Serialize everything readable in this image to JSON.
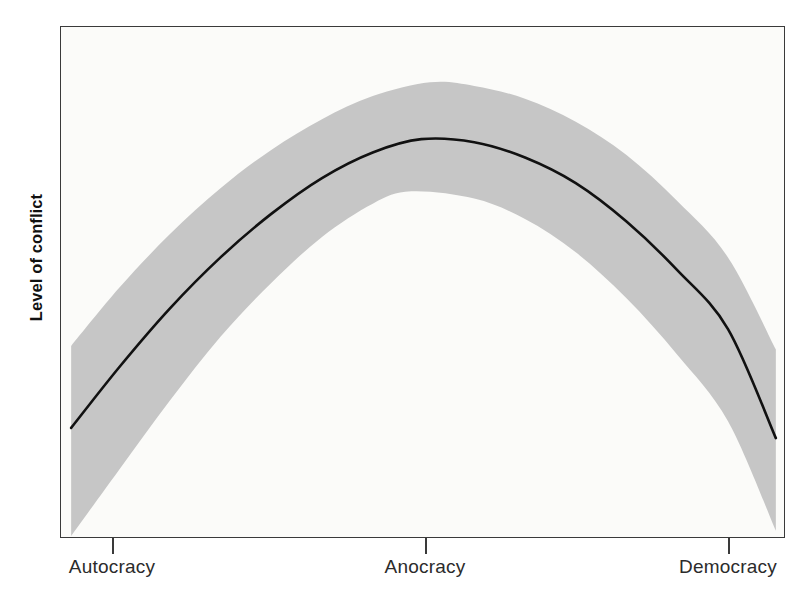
{
  "figure": {
    "y_axis_label": "Level of conflict",
    "background_color": "#fbfbf9",
    "frame_color": "#3a3a3a",
    "band_color": "#c6c6c6",
    "line_color": "#111111",
    "page_bleed_text": "thickened the relationship between regime type and civil conflict has been one of the most durable findings in the comparative study of political violence. Scholars working in this tradition have repeatedly observed that states occupying the institutional middle ground are substantially more prone to internal armed conflict than either consolidated autocracies or consolidated democracies. The relationship is therefore not monotonic but curvilinear: it rises, peaks, and falls again across the regime spectrum. Consolidated autocracies suppress dissent through coercive capacity, while consolidated democracies channel grievances through responsive institutions and credible electoral competition. Anocracies, by contrast, combine partially open institutions with limited coercive reach and weak capacity for accommodation, producing the worst of both worlds. The inverted U depicted here summarizes the pattern, and the shaded region around the fitted line reports the associated uncertainty, which widens considerably toward the extremes of the scale where observations are comparatively sparse."
  },
  "chart_data": {
    "type": "line",
    "title": "",
    "xlabel": "",
    "ylabel": "Level of conflict",
    "grid": false,
    "legend": "none",
    "xlim": [
      0,
      100
    ],
    "ylim": [
      0,
      100
    ],
    "xtick_labels": [
      "Autocracy",
      "Anocracy",
      "Democracy"
    ],
    "xtick_positions": [
      7.2,
      50.3,
      92.1
    ],
    "ytick_labels": [],
    "annotations": [],
    "series": [
      {
        "name": "Fitted level of conflict",
        "type": "line",
        "x": [
          1.4,
          8,
          15,
          22,
          29,
          36,
          43,
          49.7,
          57,
          64,
          71,
          78,
          85,
          92,
          98.6
        ],
        "y": [
          21.7,
          33.5,
          45.0,
          55.0,
          63.5,
          70.5,
          75.5,
          78.1,
          77.5,
          74.5,
          69.5,
          62.0,
          52.5,
          41.0,
          19.7
        ]
      },
      {
        "name": "Upper confidence bound",
        "type": "band_upper",
        "x": [
          1.4,
          8,
          15,
          22,
          29,
          36,
          43,
          50.9,
          57,
          64,
          71,
          78,
          85,
          92,
          98.6
        ],
        "y": [
          37.7,
          49.0,
          59.5,
          68.5,
          76.0,
          82.0,
          86.5,
          89.2,
          88.5,
          86.0,
          81.5,
          75.0,
          66.0,
          55.0,
          37.0
        ]
      },
      {
        "name": "Lower confidence bound",
        "type": "band_lower",
        "x": [
          1.4,
          8,
          15,
          22,
          29,
          36,
          43,
          48.3,
          57,
          64,
          71,
          78,
          85,
          92,
          98.6
        ],
        "y": [
          0.6,
          13.5,
          27.0,
          39.5,
          50.0,
          59.0,
          65.5,
          67.9,
          66.5,
          62.5,
          56.0,
          47.0,
          36.0,
          23.0,
          1.6
        ]
      }
    ]
  },
  "x_axis": {
    "ticks": [
      {
        "label": "Autocracy",
        "px": 112
      },
      {
        "label": "Anocracy",
        "px": 425
      },
      {
        "label": "Democracy",
        "px": 728
      }
    ]
  }
}
